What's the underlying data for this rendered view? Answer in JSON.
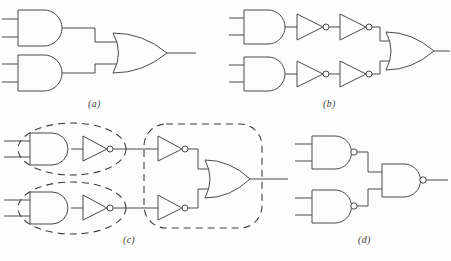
{
  "figure": {
    "background_color": "#fdfdfd",
    "line_color": "#4a4a4a",
    "dash_color": "#3f3f3f",
    "width": 451,
    "height": 261
  },
  "panels": [
    {
      "id": "a",
      "label": "(a)",
      "label_x": 88,
      "label_y": 98,
      "gates": [
        {
          "type": "and-gate",
          "name": "and-gate-top",
          "x": 18,
          "y": 10,
          "w": 52,
          "h": 36
        },
        {
          "type": "and-gate",
          "name": "and-gate-bottom",
          "x": 18,
          "y": 55,
          "w": 52,
          "h": 36
        },
        {
          "type": "or-gate",
          "name": "or-gate-output",
          "x": 113,
          "y": 33,
          "w": 54,
          "h": 40
        }
      ],
      "inputs": 4,
      "outputs": 1
    },
    {
      "id": "b",
      "label": "(b)",
      "label_x": 323,
      "label_y": 98,
      "gates": [
        {
          "type": "and-gate",
          "name": "and-gate-top",
          "x": 244,
          "y": 10,
          "w": 48,
          "h": 34
        },
        {
          "type": "and-gate",
          "name": "and-gate-bottom",
          "x": 244,
          "y": 57,
          "w": 48,
          "h": 34
        },
        {
          "type": "inverter",
          "name": "inverter-top-first",
          "x": 297,
          "y": 14,
          "w": 30,
          "h": 26
        },
        {
          "type": "inverter",
          "name": "inverter-top-second",
          "x": 340,
          "y": 14,
          "w": 30,
          "h": 26
        },
        {
          "type": "inverter",
          "name": "inverter-bottom-first",
          "x": 297,
          "y": 61,
          "w": 30,
          "h": 26
        },
        {
          "type": "inverter",
          "name": "inverter-bottom-second",
          "x": 340,
          "y": 61,
          "w": 30,
          "h": 26
        },
        {
          "type": "or-gate",
          "name": "or-gate-output",
          "x": 386,
          "y": 32,
          "w": 48,
          "h": 38
        }
      ],
      "inputs": 4,
      "outputs": 1
    },
    {
      "id": "c",
      "label": "(c)",
      "label_x": 123,
      "label_y": 234,
      "gates": [
        {
          "type": "and-gate",
          "name": "and-gate-top",
          "x": 30,
          "y": 133,
          "w": 44,
          "h": 32
        },
        {
          "type": "and-gate",
          "name": "and-gate-bottom",
          "x": 30,
          "y": 192,
          "w": 44,
          "h": 32
        },
        {
          "type": "inverter",
          "name": "inverter-top-group1",
          "x": 83,
          "y": 136,
          "w": 28,
          "h": 25
        },
        {
          "type": "inverter",
          "name": "inverter-bottom-group1",
          "x": 83,
          "y": 195,
          "w": 28,
          "h": 25
        },
        {
          "type": "inverter",
          "name": "inverter-top-group2",
          "x": 158,
          "y": 136,
          "w": 28,
          "h": 25
        },
        {
          "type": "inverter",
          "name": "inverter-bottom-group2",
          "x": 158,
          "y": 195,
          "w": 28,
          "h": 25
        },
        {
          "type": "or-gate",
          "name": "or-gate-output",
          "x": 205,
          "y": 160,
          "w": 45,
          "h": 38
        }
      ],
      "annotations": [
        {
          "type": "dashed-ellipse",
          "name": "dashed-ellipse-top",
          "cx": 72,
          "cy": 149,
          "rx": 54,
          "ry": 26
        },
        {
          "type": "dashed-ellipse",
          "name": "dashed-ellipse-bottom",
          "cx": 72,
          "cy": 208,
          "rx": 54,
          "ry": 26
        },
        {
          "type": "dashed-rounded-rect",
          "name": "dashed-rect-nor-group",
          "x": 144,
          "y": 124,
          "w": 118,
          "h": 104,
          "r": 22
        }
      ],
      "inputs": 4,
      "outputs": 1
    },
    {
      "id": "d",
      "label": "(d)",
      "label_x": 358,
      "label_y": 234,
      "gates": [
        {
          "type": "nand-gate",
          "name": "nand-gate-top",
          "x": 312,
          "y": 136,
          "w": 46,
          "h": 33
        },
        {
          "type": "nand-gate",
          "name": "nand-gate-bottom",
          "x": 312,
          "y": 190,
          "w": 46,
          "h": 33
        },
        {
          "type": "nand-gate",
          "name": "nand-gate-output",
          "x": 382,
          "y": 164,
          "w": 46,
          "h": 33
        }
      ],
      "inputs": 4,
      "outputs": 1
    }
  ]
}
